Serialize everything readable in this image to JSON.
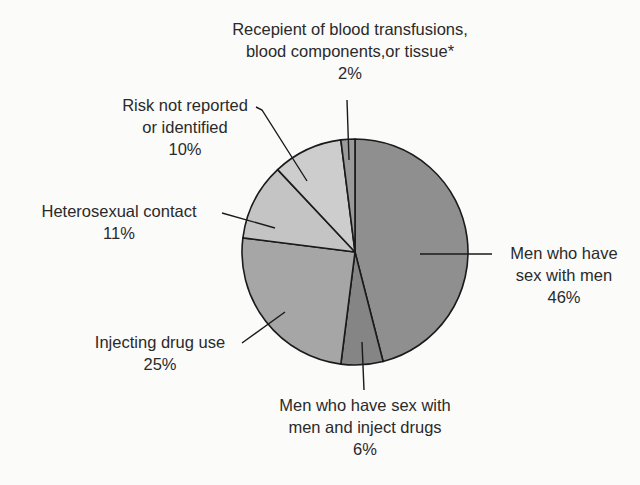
{
  "chart_data": {
    "type": "pie",
    "title": "",
    "categories": [
      "Men who have sex with men",
      "Men who have sex with men and inject drugs",
      "Injecting drug use",
      "Heterosexual contact",
      "Risk not reported or identified",
      "Recepient of blood transfusions, blood components,or tissue*"
    ],
    "values": [
      46,
      6,
      25,
      11,
      10,
      2
    ],
    "unit": "%",
    "colors": [
      "#8f8f8f",
      "#858585",
      "#a6a6a6",
      "#c4c4c4",
      "#cdcdcd",
      "#9a9a9a"
    ],
    "legend": "none (callout labels)"
  },
  "labels": {
    "msm": {
      "line1": "Men who have",
      "line2": "sex with men",
      "pct": "46%"
    },
    "msm_idu": {
      "line1": "Men who have sex with",
      "line2": "men and inject drugs",
      "pct": "6%"
    },
    "idu": {
      "line1": "Injecting drug use",
      "pct": "25%"
    },
    "hetero": {
      "line1": "Heterosexual contact",
      "pct": "11%"
    },
    "risk": {
      "line1": "Risk not reported",
      "line2": "or identified",
      "pct": "10%"
    },
    "blood": {
      "line1": "Recepient of blood transfusions,",
      "line2": "blood components,or tissue*",
      "pct": "2%"
    }
  }
}
